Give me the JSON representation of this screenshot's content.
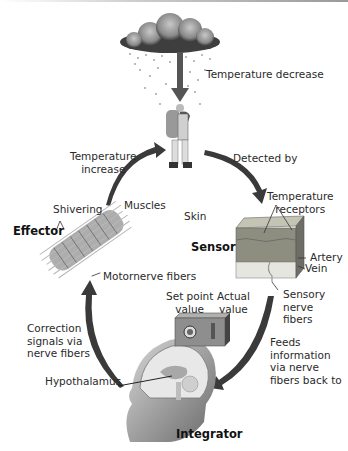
{
  "diagram": {
    "stimulus": {
      "label": "Temperature decrease",
      "icon": "rain-cloud-icon"
    },
    "subject": {
      "icon": "hiker-icon"
    },
    "steps": [
      {
        "id": "detected",
        "label": "Detected by"
      },
      {
        "id": "feeds",
        "label_lines": [
          "Feeds",
          "information",
          "via nerve",
          "fibers back to"
        ]
      },
      {
        "id": "correction",
        "label_lines": [
          "Correction",
          "signals via",
          "nerve fibers"
        ]
      },
      {
        "id": "response",
        "label_lines": [
          "Temperature",
          "increase"
        ]
      }
    ],
    "components": {
      "sensor": {
        "title": "Sensor",
        "labels": {
          "receptors_lines": [
            "Temperature",
            "receptors"
          ],
          "artery": "Artery",
          "vein": "Vein",
          "sensory_lines": [
            "Sensory",
            "nerve",
            "fibers"
          ],
          "skin": "Skin"
        }
      },
      "integrator": {
        "title": "Integrator",
        "labels": {
          "set_point_lines": [
            "Set point",
            "value"
          ],
          "actual_lines": [
            "Actual",
            "value"
          ],
          "hypothalamus": "Hypothalamus"
        }
      },
      "effector": {
        "title": "Effector",
        "labels": {
          "shivering": "Shivering",
          "muscles": "Muscles",
          "motornerve": "Motornerve fibers"
        }
      }
    },
    "colors": {
      "arrow": "#3a3a3a",
      "skin_top": "#9a9a8a",
      "box": "#8c8c8c",
      "text": "#2a2a2a"
    }
  }
}
